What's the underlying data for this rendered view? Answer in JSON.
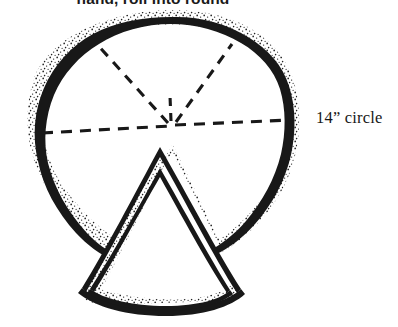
{
  "figure": {
    "caption_top": "hand, roll into round",
    "dimension_label": "14” circle",
    "ink_color": "#181818",
    "background_color": "#ffffff",
    "stipple_color": "#2a2a2a",
    "dough_round": {
      "name": "dough-round",
      "center": [
        172,
        127
      ],
      "radius_x": 134,
      "radius_y": 117,
      "edge_style": "hand-drawn stippled outline"
    },
    "cut_lines": {
      "name": "dashed-cut-lines",
      "style": "dashed",
      "count": 5,
      "converge_point": [
        172,
        127
      ],
      "endpoints": [
        [
          42,
          133
        ],
        [
          95,
          42
        ],
        [
          232,
          44
        ],
        [
          290,
          120
        ],
        [
          172,
          98
        ]
      ]
    },
    "removed_wedge": {
      "name": "removed-wedge",
      "apex": [
        160,
        155
      ],
      "base_left": [
        82,
        300
      ],
      "base_right": [
        236,
        295
      ],
      "outline_style": "double line with stippled crust edge"
    }
  }
}
